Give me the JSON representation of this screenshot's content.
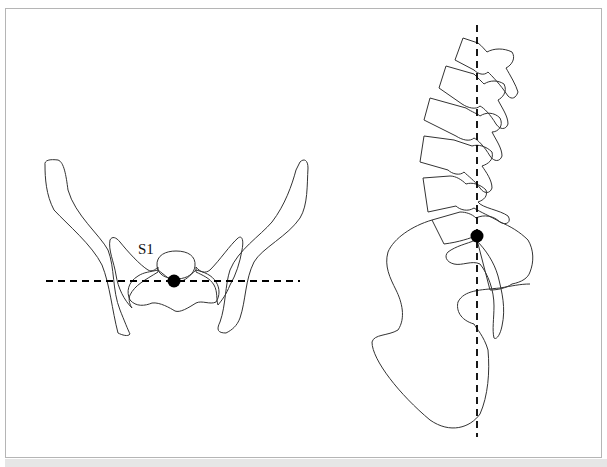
{
  "figure": {
    "panels": [
      {
        "id": "frontal-pelvis",
        "view": "anterior-posterior",
        "label": "S1",
        "marker": "S1 center point",
        "reference_line": "horizontal dashed line"
      },
      {
        "id": "lateral-spine",
        "view": "sagittal",
        "marker": "S1 center point",
        "reference_line": "vertical dashed line"
      }
    ],
    "colors": {
      "outline": "#333333",
      "marker": "#000000",
      "border": "#b5b5b5",
      "background": "#ffffff"
    }
  }
}
